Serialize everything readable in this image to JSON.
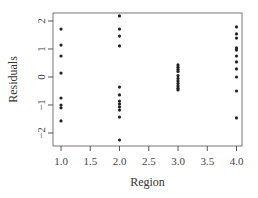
{
  "chart_data": {
    "type": "scatter",
    "title": "",
    "xlabel": "Region",
    "ylabel": "Residuals",
    "xlim": [
      0.9,
      4.1
    ],
    "ylim": [
      -2.45,
      2.3
    ],
    "x_ticks": [
      1.0,
      1.5,
      2.0,
      2.5,
      3.0,
      3.5,
      4.0
    ],
    "x_tick_labels": [
      "1.0",
      "1.5",
      "2.0",
      "2.5",
      "3.0",
      "3.5",
      "4.0"
    ],
    "y_ticks": [
      -2,
      -1,
      0,
      1,
      2
    ],
    "y_tick_labels": [
      "−2",
      "−1",
      "0",
      "1",
      "2"
    ],
    "grid": false,
    "legend": null,
    "series": [
      {
        "name": "Region 1",
        "x": 1.0,
        "values": [
          1.71,
          1.14,
          0.75,
          0.14,
          -0.75,
          -1.0,
          -1.1,
          -1.57
        ]
      },
      {
        "name": "Region 2",
        "x": 2.0,
        "values": [
          2.18,
          1.71,
          1.46,
          1.11,
          -0.36,
          -0.64,
          -0.86,
          -0.96,
          -1.07,
          -1.18,
          -1.43,
          -2.25
        ]
      },
      {
        "name": "Region 3",
        "x": 3.0,
        "values": [
          0.43,
          0.35,
          0.27,
          0.2,
          0.05,
          -0.05,
          -0.14,
          -0.23,
          -0.32,
          -0.4,
          -0.46
        ]
      },
      {
        "name": "Region 4",
        "x": 4.0,
        "values": [
          1.79,
          1.54,
          1.39,
          1.04,
          0.96,
          0.75,
          0.54,
          0.29,
          0.0,
          -0.5,
          -1.46
        ]
      }
    ],
    "colors": {
      "points": "#222222",
      "axis": "#555555",
      "box": "#777777"
    }
  }
}
